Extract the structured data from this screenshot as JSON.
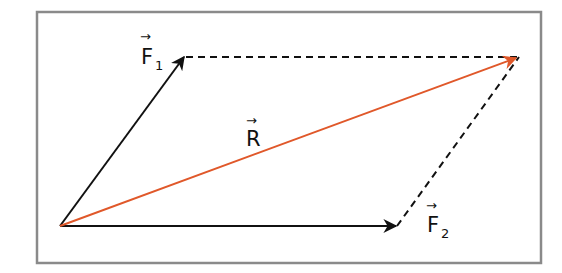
{
  "diagram": {
    "colors": {
      "frame": "#8a8a8a",
      "vector": "#111111",
      "resultant": "#e0582a",
      "dashed": "#111111",
      "background": "#ffffff"
    },
    "points": {
      "origin": [
        60,
        226
      ],
      "f1_tip": [
        185,
        56
      ],
      "f2_tip": [
        397,
        226
      ],
      "r_tip": [
        518,
        57
      ]
    },
    "labels": {
      "f1": {
        "letter": "F",
        "subscript": "1",
        "arrow": "→"
      },
      "f2": {
        "letter": "F",
        "subscript": "2",
        "arrow": "→"
      },
      "r": {
        "letter": "R",
        "arrow": "→"
      }
    }
  }
}
